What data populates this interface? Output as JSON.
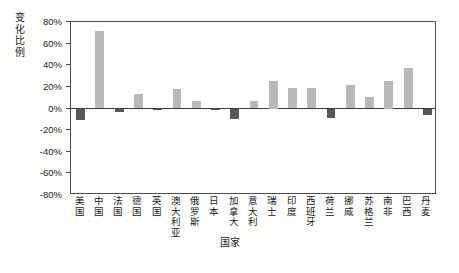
{
  "chart_data": {
    "type": "bar",
    "title": "",
    "xlabel": "国家",
    "ylabel": "变化比例",
    "ylim": [
      -80,
      80
    ],
    "ytick_labels": [
      "80%",
      "60%",
      "40%",
      "20%",
      "0%",
      "-20%",
      "-40%",
      "-60%",
      "-80%"
    ],
    "ytick_values": [
      80,
      60,
      40,
      20,
      0,
      -20,
      -40,
      -60,
      -80
    ],
    "grid": false,
    "legend": "none",
    "value_suffix": "%",
    "categories": [
      "美国",
      "中国",
      "法国",
      "德国",
      "英国",
      "澳大利亚",
      "俄罗斯",
      "日本",
      "加拿大",
      "意大利",
      "瑞士",
      "印度",
      "西班牙",
      "荷兰",
      "挪威",
      "苏格兰",
      "南非",
      "巴西",
      "丹麦"
    ],
    "values": [
      -11,
      72,
      -3,
      13,
      -1,
      18,
      7,
      -1,
      -10,
      7,
      25,
      19,
      19,
      -9,
      22,
      11,
      25,
      37,
      -6
    ],
    "series": [
      {
        "name": "变化比例",
        "values": [
          -11,
          72,
          -3,
          13,
          -1,
          18,
          7,
          -1,
          -10,
          7,
          25,
          19,
          19,
          -9,
          22,
          11,
          25,
          37,
          -6
        ]
      }
    ],
    "colors": {
      "positive_bar": "#b9b9b9",
      "negative_bar": "#585858",
      "axis": "#4d4d4d",
      "text": "#1a1a1a"
    }
  },
  "caption": ""
}
